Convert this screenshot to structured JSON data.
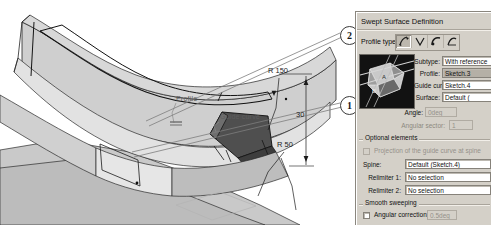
{
  "viewport": {
    "name": "cad-3d-viewport",
    "labels": [
      {
        "id": "profile-label",
        "text": "Profile",
        "x": 176,
        "y": 99
      },
      {
        "id": "guide-curve-label",
        "text": "Guide curve",
        "x": 218,
        "y": 117
      }
    ],
    "dimensions": [
      {
        "id": "radius-150",
        "text": "R 150",
        "x": 268,
        "y": 70
      },
      {
        "id": "length-30",
        "text": "30",
        "x": 303,
        "y": 112
      },
      {
        "id": "radius-50",
        "text": "R 50",
        "x": 283,
        "y": 144
      }
    ],
    "callouts": [
      {
        "id": "callout-2",
        "text": "2",
        "x": 340,
        "y": 26
      },
      {
        "id": "callout-1",
        "text": "1",
        "x": 340,
        "y": 96
      }
    ]
  },
  "dialog": {
    "title": "Swept Surface Definition",
    "profile_type": {
      "label": "Profile type:",
      "options": [
        {
          "id": "profile-type-explicit",
          "name": "explicit-sweep-icon",
          "selected": true
        },
        {
          "id": "profile-type-line",
          "name": "line-sweep-icon",
          "selected": false
        },
        {
          "id": "profile-type-circle",
          "name": "circle-sweep-icon",
          "selected": false
        },
        {
          "id": "profile-type-conic",
          "name": "conic-sweep-icon",
          "selected": false
        }
      ]
    },
    "preview": {
      "name": "sweep-preview-thumbnail"
    },
    "fields": [
      {
        "id": "subtype",
        "label": "Subtype:",
        "value": "With reference",
        "state": "normal"
      },
      {
        "id": "profile",
        "label": "Profile:",
        "value": "Sketch.3",
        "state": "selected"
      },
      {
        "id": "guide-curve",
        "label": "Guide curve:",
        "value": "Sketch.4",
        "state": "normal"
      },
      {
        "id": "surface",
        "label": "Surface:",
        "value": "Default (",
        "state": "normal"
      },
      {
        "id": "angle",
        "label": "Angle:",
        "value": "0deg",
        "state": "disabled"
      },
      {
        "id": "angular-sector",
        "label": "Angular sector:",
        "value": "1",
        "state": "disabled"
      }
    ],
    "optional_elements": {
      "group_label": "Optional elements",
      "projection_checkbox": {
        "label": "Projection of the guide curve at spine",
        "checked": false,
        "disabled": true
      },
      "rows": [
        {
          "id": "spine",
          "label": "Spine:",
          "value": "Default (Sketch.4)"
        },
        {
          "id": "relimiter-1",
          "label": "Relimiter 1:",
          "value": "No selection"
        },
        {
          "id": "relimiter-2",
          "label": "Relimiter 2:",
          "value": "No selection"
        }
      ]
    },
    "smooth_sweeping": {
      "group_label": "Smooth sweeping",
      "angular_correction": {
        "label": "Angular correction:",
        "value": "0.5deg",
        "checked": false
      }
    }
  },
  "colors": {
    "dialog_face": "#d4d0c8",
    "field_bg": "#ffffff",
    "selected_field": "#b5b0a6",
    "disabled_text": "#94908a",
    "model_light": "#d9d9d9",
    "model_mid": "#b4b4b4",
    "model_dark": "#8c8c8c",
    "model_shadow": "#4a4a4a",
    "outline": "#1a1a1a"
  }
}
